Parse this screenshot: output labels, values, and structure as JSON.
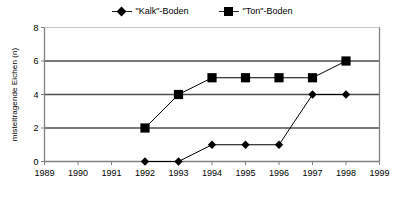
{
  "chart_data": {
    "type": "line",
    "title": "",
    "xlabel": "",
    "ylabel": "misteltragende Eichen (n)",
    "x": [
      1989,
      1990,
      1991,
      1992,
      1993,
      1994,
      1995,
      1996,
      1997,
      1998,
      1999
    ],
    "xtick_labels": [
      "1989",
      "1990",
      "1991",
      "1992",
      "1993",
      "1994",
      "1995",
      "1996",
      "1997",
      "1998",
      "1999"
    ],
    "xlim": [
      1989,
      1999
    ],
    "ylim": [
      0,
      8
    ],
    "ytick_labels": [
      "0",
      "2",
      "4",
      "6",
      "8"
    ],
    "ytick_values": [
      0,
      2,
      4,
      6,
      8
    ],
    "grid": "horizontal",
    "gridlines_at": [
      2,
      4,
      6,
      8
    ],
    "legend_position": "top-center",
    "series": [
      {
        "name": "\"Kalk\"-Boden",
        "marker": "diamond",
        "color": "#000000",
        "x": [
          1992,
          1993,
          1994,
          1995,
          1996,
          1997,
          1998
        ],
        "values": [
          0,
          0,
          1,
          1,
          1,
          4,
          4
        ]
      },
      {
        "name": "\"Ton\"-Boden",
        "marker": "square",
        "color": "#000000",
        "x": [
          1992,
          1993,
          1994,
          1995,
          1996,
          1997,
          1998
        ],
        "values": [
          2,
          4,
          5,
          5,
          5,
          5,
          6
        ]
      }
    ]
  },
  "legend": {
    "entries": [
      {
        "label": "\"Kalk\"-Boden",
        "marker": "diamond-marker-icon"
      },
      {
        "label": "\"Ton\"-Boden",
        "marker": "square-marker-icon"
      }
    ]
  },
  "axes": {
    "y_axis_title": "misteltragende Eichen (n)",
    "y_ticks": [
      "0",
      "2",
      "4",
      "6",
      "8"
    ],
    "x_ticks": [
      "1989",
      "1990",
      "1991",
      "1992",
      "1993",
      "1994",
      "1995",
      "1996",
      "1997",
      "1998",
      "1999"
    ]
  },
  "colors": {
    "series": "#000000",
    "gridline": "#4d4d4d",
    "gridline_light": "#c9c9c9",
    "axis": "#808080",
    "background": "#ffffff"
  }
}
